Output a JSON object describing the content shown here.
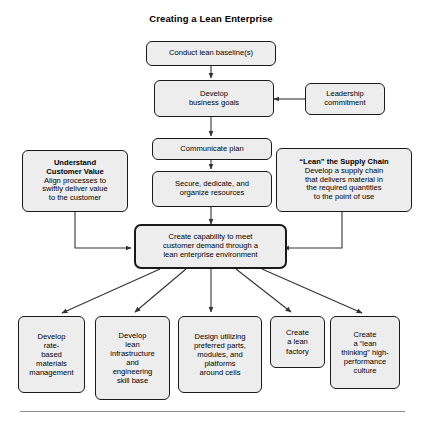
{
  "title": "Creating a Lean Enterprise",
  "flow": {
    "baseline": "Conduct lean baseline(s)",
    "goals": "Develop\nbusiness goals",
    "leadership": "Leadership\ncommitment",
    "communicate": "Communicate plan",
    "secure": "Secure, dedicate, and\norganize resources",
    "hub": "Create capability to meet\ncustomer demand through a\nlean enterprise environment"
  },
  "side": {
    "customer_value": {
      "heading": "Understand\nCustomer Value",
      "body": "Align processes to\nswiftly deliver value\nto the customer"
    },
    "supply_chain": {
      "heading": "“Lean” the Supply Chain",
      "body": "Develop a supply chain\nthat delivers material in\nthe required quantities\nto the point of use"
    }
  },
  "outcomes": [
    "Develop\nrate-\nbased\nmaterials\nmanagement",
    "Develop\nlean\ninfrastructure\nand\nengineering\nskill base",
    "Design utilizing\npreferred parts,\nmodules, and\nplatforms\naround cells",
    "Create\na lean\nfactory",
    "Create\na “lean\nthinking” high-\nperformance\nculture"
  ],
  "colors": {
    "box_fill": "#ededed",
    "box_border": "#1a1a1a",
    "connector": "#333333",
    "rule": "#8d8d8d"
  }
}
